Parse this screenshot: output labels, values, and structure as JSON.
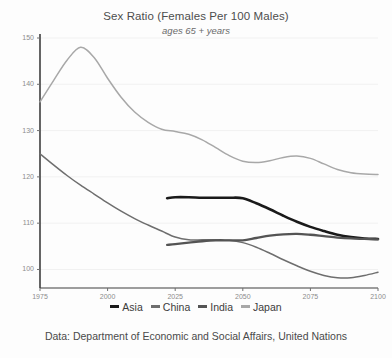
{
  "chart_title": "Sex Ratio (Females Per 100 Males)",
  "chart_subtitle": "ages 65 + years",
  "footer": "Data: Department of Economic and Social Affairs, United Nations",
  "legend": {
    "position": "bottom",
    "items": [
      {
        "label": "Asia",
        "color": "#1a1a1a"
      },
      {
        "label": "China",
        "color": "#6e6e6e"
      },
      {
        "label": "India",
        "color": "#545454"
      },
      {
        "label": "Japan",
        "color": "#a8a8a8"
      }
    ]
  },
  "axis": {
    "y_ticks": [
      "150",
      "140",
      "130",
      "120",
      "110",
      "100"
    ],
    "x_ticks": [
      "1975",
      "2000",
      "2025",
      "2050",
      "2075",
      "2100"
    ]
  },
  "chart_data": {
    "type": "line",
    "title": "Sex Ratio (Females Per 100 Males)",
    "subtitle": "ages 65 + years",
    "xlabel": "",
    "ylabel": "Females per 100 males",
    "xlim": [
      1975,
      2100
    ],
    "ylim": [
      95,
      150
    ],
    "grid": true,
    "legend_position": "bottom",
    "annotation": "Data: Department of Economic and Social Affairs, United Nations",
    "x": [
      1975,
      1980,
      1985,
      1990,
      1995,
      2000,
      2005,
      2010,
      2015,
      2020,
      2022,
      2025,
      2030,
      2035,
      2040,
      2045,
      2050,
      2055,
      2060,
      2065,
      2070,
      2075,
      2080,
      2085,
      2090,
      2095,
      2100
    ],
    "series": [
      {
        "name": "Asia",
        "color": "#1a1a1a",
        "x": [
          2022,
          2025,
          2030,
          2035,
          2040,
          2045,
          2050,
          2055,
          2060,
          2065,
          2070,
          2075,
          2080,
          2085,
          2090,
          2095,
          2100
        ],
        "values": [
          115.4,
          115.6,
          115.6,
          115.5,
          115.5,
          115.5,
          115.4,
          114.3,
          113.0,
          111.6,
          110.3,
          109.2,
          108.3,
          107.5,
          107.0,
          106.7,
          106.6
        ]
      },
      {
        "name": "China",
        "color": "#6e6e6e",
        "x": [
          1975,
          1980,
          1985,
          1990,
          1995,
          2000,
          2005,
          2010,
          2015,
          2020,
          2025,
          2030,
          2035,
          2040,
          2045,
          2050,
          2055,
          2060,
          2065,
          2070,
          2075,
          2080,
          2085,
          2090,
          2095,
          2100
        ],
        "values": [
          125.0,
          122.6,
          120.3,
          118.2,
          116.3,
          114.4,
          112.6,
          111.0,
          109.6,
          108.3,
          107.0,
          106.4,
          106.4,
          106.4,
          106.3,
          105.8,
          104.8,
          103.5,
          102.1,
          100.8,
          99.6,
          98.7,
          98.2,
          98.2,
          98.7,
          99.4
        ]
      },
      {
        "name": "India",
        "color": "#545454",
        "x": [
          2022,
          2025,
          2030,
          2035,
          2040,
          2045,
          2050,
          2055,
          2060,
          2065,
          2070,
          2075,
          2080,
          2085,
          2090,
          2095,
          2100
        ],
        "values": [
          105.3,
          105.5,
          105.8,
          106.1,
          106.3,
          106.3,
          106.3,
          106.8,
          107.3,
          107.6,
          107.7,
          107.5,
          107.2,
          106.9,
          106.7,
          106.6,
          106.5
        ]
      },
      {
        "name": "Japan",
        "color": "#a8a8a8",
        "x": [
          1975,
          1980,
          1985,
          1990,
          1995,
          2000,
          2005,
          2010,
          2015,
          2020,
          2025,
          2030,
          2035,
          2040,
          2045,
          2050,
          2055,
          2060,
          2065,
          2070,
          2075,
          2080,
          2085,
          2090,
          2095,
          2100
        ],
        "values": [
          136.2,
          140.8,
          145.2,
          148.0,
          145.8,
          141.3,
          137.2,
          134.0,
          131.8,
          130.3,
          129.8,
          129.2,
          128.0,
          126.3,
          124.6,
          123.4,
          123.1,
          123.5,
          124.2,
          124.5,
          124.0,
          122.8,
          121.6,
          120.9,
          120.6,
          120.5
        ]
      }
    ]
  }
}
